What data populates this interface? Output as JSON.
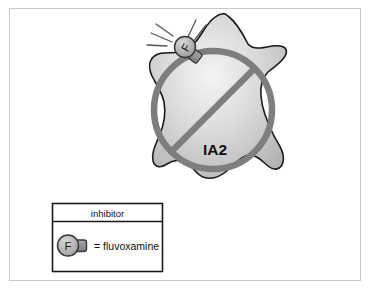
{
  "figure": {
    "title_text": "IA2",
    "background_color": "#ffffff",
    "frame_color": "#c9c9c9"
  },
  "cell": {
    "label": "IA2",
    "label_color": "#111111",
    "fill_light": "#f2f2f2",
    "fill_mid": "#c8c8c8",
    "fill_dark": "#b0b0b0",
    "outline_color": "#1a1a1a"
  },
  "prohibition_circle": {
    "stroke_color": "#7e7e7e",
    "slash_color": "#7e7e7e",
    "meaning": "blocked"
  },
  "inhibitor_marker": {
    "letter": "F",
    "circle_fill": "#b3b3b3",
    "circle_stroke": "#3a3a3a",
    "tail_fill": "#8c8c8c",
    "impact_line_color": "#555555",
    "impact_line_count": 5
  },
  "legend": {
    "header": "inhibitor",
    "border_color": "#1a1a1a",
    "rows": [
      {
        "symbol_letter": "F",
        "text": "= fluvoxamine"
      }
    ]
  }
}
